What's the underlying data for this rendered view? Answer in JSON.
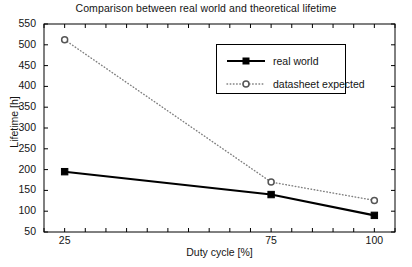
{
  "chart_data": {
    "type": "line",
    "title": "Comparison between real world and theoretical lifetime",
    "xlabel": "Duty cycle [%]",
    "ylabel": "Lifetime [h]",
    "x": [
      25,
      75,
      100
    ],
    "xlim": [
      20,
      105
    ],
    "ylim": [
      50,
      550
    ],
    "grid": false,
    "legend_position": "upper center",
    "xticks_labeled": [
      "25",
      "75",
      "100"
    ],
    "xtick_values": [
      25,
      75,
      100
    ],
    "xtick_minor_step": 5,
    "yticks": [
      "50",
      "100",
      "150",
      "200",
      "250",
      "300",
      "350",
      "400",
      "450",
      "500",
      "550"
    ],
    "ytick_values": [
      50,
      100,
      150,
      200,
      250,
      300,
      350,
      400,
      450,
      500,
      550
    ],
    "series": [
      {
        "name": "real world",
        "values": [
          195,
          140,
          90
        ],
        "color": "#000000",
        "linestyle": "solid",
        "marker": "filled-square"
      },
      {
        "name": "datasheet expected",
        "values": [
          512,
          170,
          126
        ],
        "color": "#808080",
        "linestyle": "dotted",
        "marker": "open-circle"
      }
    ]
  },
  "legend": {
    "entries": [
      {
        "label": "real world"
      },
      {
        "label": "datasheet expected"
      }
    ]
  }
}
